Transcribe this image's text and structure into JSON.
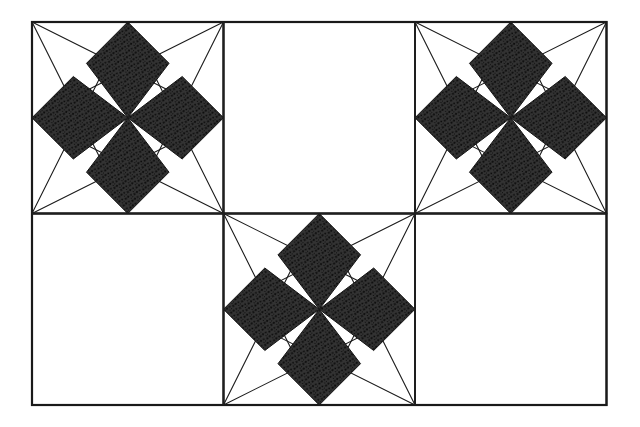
{
  "figure": {
    "title": "Tessellation of squares with four-petal star motifs",
    "medium": "ink line drawing on white paper",
    "grid": {
      "columns": 3,
      "rows": 2,
      "cell_size_px": 191.5,
      "origin_x": 32,
      "origin_y": 22,
      "total_width_px": 574.5,
      "total_height_px": 389
    },
    "colors": {
      "paper": "#ffffff",
      "ink": "#1a1a1a",
      "fill_dark": "#333333",
      "stipple": "#0d0d0d",
      "border": "#222222"
    },
    "stroke": {
      "outer_border_px": 2.2,
      "cell_divider_px": 1.8,
      "construction_line_px": 1.1,
      "petal_outline_px": 1.0
    },
    "motif": {
      "name": "four-petal-star",
      "petal_count": 4,
      "petal_shape": "kite",
      "petal_tip_location": "edge midpoint",
      "petal_waist_fraction": 0.22,
      "petal_half_width_fraction": 0.215,
      "construction": "each square corner is joined by straight lines to the two midpoints of the non-adjacent sides and to the square centre",
      "symmetry": "4-fold rotational (C4)"
    },
    "cells": [
      {
        "row": 0,
        "col": 0,
        "name": "top-left",
        "filled": true,
        "motif": "four-petal-star"
      },
      {
        "row": 0,
        "col": 1,
        "name": "top-center",
        "filled": false,
        "motif": null
      },
      {
        "row": 0,
        "col": 2,
        "name": "top-right",
        "filled": true,
        "motif": "four-petal-star"
      },
      {
        "row": 1,
        "col": 0,
        "name": "bottom-left",
        "filled": false,
        "motif": null
      },
      {
        "row": 1,
        "col": 1,
        "name": "bottom-center",
        "filled": true,
        "motif": "four-petal-star"
      },
      {
        "row": 1,
        "col": 2,
        "name": "bottom-right",
        "filled": false,
        "motif": null
      }
    ]
  }
}
